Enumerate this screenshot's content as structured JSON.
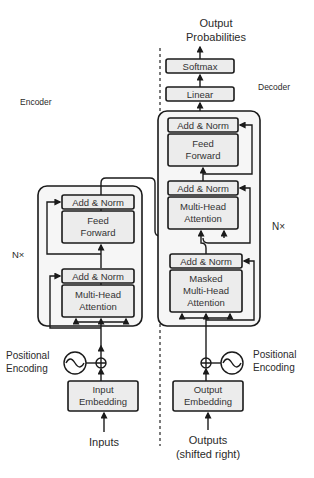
{
  "diagram": {
    "colors": {
      "block_fill": "#ececec",
      "stack_fill": "#f6f6f6",
      "stroke": "#1a1a1a",
      "text": "#333333"
    },
    "encoder": {
      "section_label": "Encoder",
      "repeat_label": "N×",
      "input_label": "Inputs",
      "embedding_line1": "Input",
      "embedding_line2": "Embedding",
      "positional_line1": "Positional",
      "positional_line2": "Encoding",
      "blocks": {
        "add_norm_top": "Add & Norm",
        "ff_line1": "Feed",
        "ff_line2": "Forward",
        "add_norm_bottom": "Add & Norm",
        "mha_line1": "Multi-Head",
        "mha_line2": "Attention"
      }
    },
    "decoder": {
      "section_label": "Decoder",
      "repeat_label": "N×",
      "input_line1": "Outputs",
      "input_line2": "(shifted right)",
      "embedding_line1": "Output",
      "embedding_line2": "Embedding",
      "positional_line1": "Positional",
      "positional_line2": "Encoding",
      "blocks": {
        "add_norm_1": "Add & Norm",
        "ff_line1": "Feed",
        "ff_line2": "Forward",
        "add_norm_2": "Add & Norm",
        "mha_line1": "Multi-Head",
        "mha_line2": "Attention",
        "add_norm_3": "Add & Norm",
        "masked_line1": "Masked",
        "masked_line2": "Multi-Head",
        "masked_line3": "Attention"
      },
      "linear": "Linear",
      "softmax": "Softmax",
      "output_line1": "Output",
      "output_line2": "Probabilities"
    }
  }
}
